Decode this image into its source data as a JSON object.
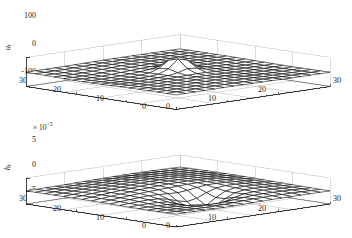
{
  "figure": {
    "background": "#ffffff",
    "ink": "#000000",
    "grid_color": "#b9b9b9"
  },
  "chart_data": [
    {
      "id": "top",
      "type": "surface",
      "title": "",
      "zlabel": "u",
      "zlabel_sub": "t",
      "xlabel": "",
      "ylabel": "",
      "grid": true,
      "legend": null,
      "exponent_label": "",
      "z_ticks": [
        100,
        0,
        -100
      ],
      "z_ticklabels": [
        "100",
        "0",
        "-100"
      ],
      "zlim": [
        -100,
        100
      ],
      "x_ticks": [
        0,
        10,
        20,
        30
      ],
      "x_ticklabels": [
        "0",
        "10",
        "20",
        "30"
      ],
      "xlim": [
        0,
        30
      ],
      "y_ticks": [
        0,
        10,
        20,
        30
      ],
      "y_ticklabels": [
        "0",
        "10",
        "20",
        "30"
      ],
      "ylim": [
        0,
        30
      ],
      "left_axis_ticklabels": [
        "30",
        "20",
        "10",
        "0"
      ],
      "right_axis_ticklabels": [
        "0",
        "10",
        "20",
        "30"
      ],
      "description": "Mesh surface, near-zero flat plateau with a single sharp positive spike near the centre of the domain",
      "grid_n": 16,
      "peak": {
        "x": 15,
        "y": 15,
        "z": 95
      },
      "baseline": 0
    },
    {
      "id": "bottom",
      "type": "surface",
      "title": "",
      "zlabel": "h",
      "zlabel_sub": "t",
      "xlabel": "",
      "ylabel": "",
      "grid": true,
      "legend": null,
      "exponent_label": "× 10",
      "exponent_value": "-5",
      "z_ticks": [
        5,
        0,
        -5
      ],
      "z_ticklabels": [
        "5",
        "0",
        "-5"
      ],
      "zlim": [
        -5,
        5
      ],
      "x_ticks": [
        0,
        10,
        20,
        30
      ],
      "x_ticklabels": [
        "0",
        "10",
        "20",
        "30"
      ],
      "xlim": [
        0,
        30
      ],
      "y_ticks": [
        0,
        10,
        20,
        30
      ],
      "y_ticklabels": [
        "0",
        "10",
        "20",
        "30"
      ],
      "ylim": [
        0,
        30
      ],
      "left_axis_ticklabels": [
        "30",
        "20",
        "10",
        "0"
      ],
      "right_axis_ticklabels": [
        "0",
        "10",
        "20",
        "30"
      ],
      "description": "Mesh surface, raised gently toward the back with a pronounced negative dip near the front centre of the domain",
      "grid_n": 16,
      "trough": {
        "x": 15,
        "y": 10,
        "z": -4.5
      },
      "baseline": 0
    }
  ],
  "panels": {
    "top": {
      "zticks": [
        "100",
        "0",
        "-100"
      ],
      "left_xticks": [
        "30",
        "20",
        "10",
        "0"
      ],
      "right_xticks": [
        "0",
        "10",
        "20",
        "30"
      ],
      "ylabel": "u",
      "ylabel_sub": "t"
    },
    "bottom": {
      "zticks": [
        "5",
        "0",
        "-5"
      ],
      "left_xticks": [
        "30",
        "20",
        "10",
        "0"
      ],
      "right_xticks": [
        "0",
        "10",
        "20",
        "30"
      ],
      "ylabel": "h",
      "ylabel_sub": "t",
      "exponent_prefix": "× 10",
      "exponent_sup": "−5"
    }
  }
}
